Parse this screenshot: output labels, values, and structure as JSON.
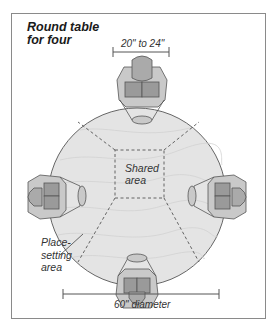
{
  "title_lines": [
    "Round table",
    "for four"
  ],
  "dimensions": {
    "person_width": "20\" to 24\"",
    "table_diameter": "60\" diameter"
  },
  "labels": {
    "shared_area": [
      "Shared",
      "area"
    ],
    "place_setting_area": [
      "Place-",
      "setting",
      "area"
    ]
  },
  "colors": {
    "table_fill": "#e4e4e4",
    "person_light": "#c9c9c9",
    "person_dark": "#9a9a9a",
    "line": "#555555",
    "frame": "#8a8a8a"
  }
}
